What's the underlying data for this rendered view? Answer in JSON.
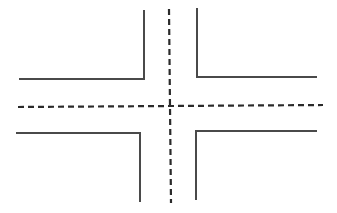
{
  "diagram": {
    "type": "road-intersection",
    "colors": {
      "curb": "#4a4a4a",
      "centerline": "#2a2a2a",
      "background": "#ffffff"
    },
    "curbs": [
      {
        "name": "top-left",
        "points": "19,79 144,79 144,10"
      },
      {
        "name": "top-right",
        "points": "197,8 197,77 317,77"
      },
      {
        "name": "bottom-left",
        "points": "16,133 140,133 140,202"
      },
      {
        "name": "bottom-right",
        "points": "196,200 196,131 317,131"
      }
    ],
    "centerlines": [
      {
        "name": "horizontal",
        "x1": 18,
        "y1": 107,
        "x2": 323,
        "y2": 105
      },
      {
        "name": "vertical",
        "x1": 169,
        "y1": 9,
        "x2": 171,
        "y2": 203
      }
    ]
  }
}
